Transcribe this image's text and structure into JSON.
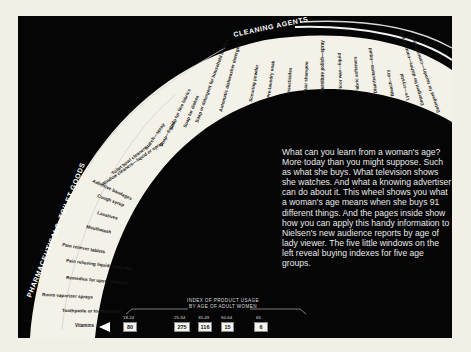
{
  "categories": {
    "cleaning": "CLEANING AGENTS",
    "pharma": "PHARMACEUTICALS, TOILET GOODS"
  },
  "wheel_items": {
    "cleaning": [
      "Toilet bowl cleaners",
      "Starch—spray",
      "Soap—liquid",
      "Soap for fine fabrics",
      "Soap for dishes",
      "Soap or detergent for household laundry",
      "Automatic dishwasher detergent",
      "Scouring powder",
      "Pre-laundry soak",
      "Insecticides",
      "Hair shampoo",
      "Furniture polish—spray",
      "Floor wax—liquid",
      "Fabric softeners",
      "Disinfectants—liquid",
      "Bleach—dry",
      "Lye—crystal",
      "Detergent for dishes—concentrated",
      "Detergent for laundry—concentrated"
    ],
    "pharma": [
      "Window cleaners—liquid or spray",
      "Adhesive bandages",
      "Cough syrup",
      "Laxatives",
      "Mouthwash",
      "Pain reliever tablets",
      "Pain relieving liquids and rubs",
      "Remedies for upset stomach",
      "Room vaporizer sprays",
      "Toothpaste or toothpowder",
      "Vitamins"
    ]
  },
  "selected_item": "Vitamins",
  "body_copy": "What can you learn from a woman's age? More today than you might suppose. Such as what she buys. What television shows she watches. And what a knowing advertiser can do about it. This wheel shows you what a woman's age means when she buys 91 different things. And the pages inside show how you can apply this handy information to Nielsen's new audience reports by age of lady viewer. The five little windows on the left reveal buying indexes for five age groups.",
  "index": {
    "title_line1": "INDEX OF PRODUCT USAGE",
    "title_line2": "BY AGE OF ADULT WOMEN",
    "groups": [
      {
        "age": "18-24",
        "value": "80"
      },
      {
        "age": "25-34",
        "value": "275"
      },
      {
        "age": "35-49",
        "value": "116"
      },
      {
        "age": "50-64",
        "value": "15"
      },
      {
        "age": "65",
        "value": "6"
      }
    ]
  },
  "colors": {
    "panel": "#050505",
    "ring": "#f3f1e8",
    "paper": "#f1efe6"
  }
}
